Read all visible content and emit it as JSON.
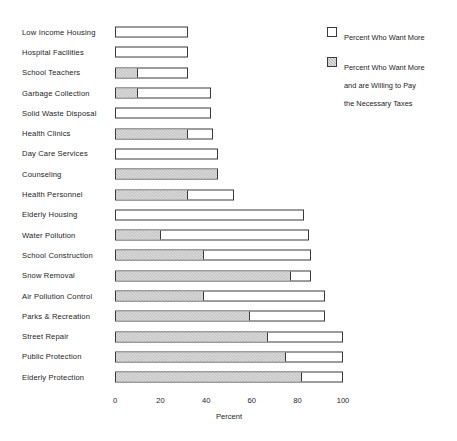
{
  "chart_data": {
    "type": "bar",
    "orientation": "horizontal",
    "title": "",
    "xlabel": "Percent",
    "ylabel": "",
    "xlim": [
      0,
      100
    ],
    "xticks": [
      0,
      20,
      40,
      60,
      80,
      100
    ],
    "grid": false,
    "legend_position": "top-right",
    "categories": [
      "Low Income Housing",
      "Hospital Facilities",
      "School Teachers",
      "Garbage Collection",
      "Solid Waste Disposal",
      "Health Clinics",
      "Day Care Services",
      "Counseling",
      "Health Personnel",
      "Elderly Housing",
      "Water Pollution",
      "School Construction",
      "Snow Removal",
      "Air Pollution Control",
      "Parks & Recreation",
      "Street Repair",
      "Public Protection",
      "Elderly Protection"
    ],
    "series": [
      {
        "name": "Percent Who Want More",
        "values": [
          32,
          32,
          32,
          42,
          42,
          43,
          45,
          45,
          52,
          83,
          85,
          86,
          86,
          92,
          92,
          100,
          100,
          100
        ]
      },
      {
        "name": "Percent Who Want More and are Willing to Pay the Necessary Taxes",
        "values": [
          0,
          0,
          10,
          10,
          0,
          32,
          0,
          45,
          32,
          0,
          20,
          39,
          77,
          39,
          59,
          67,
          75,
          82
        ]
      }
    ]
  },
  "legend": {
    "items": [
      {
        "label": "Percent Who Want More",
        "swatch": "open"
      },
      {
        "label": "Percent Who Want More\nand are Willing to Pay\nthe Necessary Taxes",
        "swatch": "shaded"
      }
    ]
  },
  "axis": {
    "title": "Percent",
    "ticks": [
      "0",
      "20",
      "40",
      "60",
      "80",
      "100"
    ]
  },
  "colors": {
    "bar_outline": "#3a3a3a",
    "bar_fill_open": "#ffffff",
    "bar_fill_shaded": "#b4b4b4",
    "text": "#1c1c1c",
    "background": "#ffffff"
  }
}
